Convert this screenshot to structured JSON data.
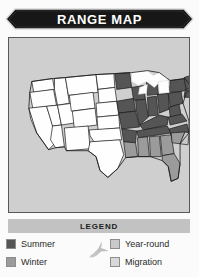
{
  "header": {
    "title": "RANGE MAP",
    "banner_color": "#171717",
    "banner_text_color": "#ffffff"
  },
  "map": {
    "name": "united-states-range-map",
    "panel_background": "#cfcfcf",
    "panel_border_color": "#58585a",
    "state_outline_color": "#1a1a1a",
    "regions": {
      "summer": "#555555",
      "winter": "#9b9b9b",
      "year_round": "#c9c9c9",
      "migration": "#d8d8d8",
      "none": "#fefefe"
    }
  },
  "legend": {
    "title": "LEGEND",
    "bar_color": "#c2c2c2",
    "bird_icon": "flying-bird-silhouette",
    "bird_color": "#bfbfbf",
    "items": [
      {
        "label": "Summer",
        "color": "#555555",
        "column": "left"
      },
      {
        "label": "Winter",
        "color": "#9b9b9b",
        "column": "left"
      },
      {
        "label": "Year-round",
        "color": "#c9c9c9",
        "column": "right"
      },
      {
        "label": "Migration",
        "color": "#d8d8d8",
        "column": "right"
      }
    ]
  }
}
